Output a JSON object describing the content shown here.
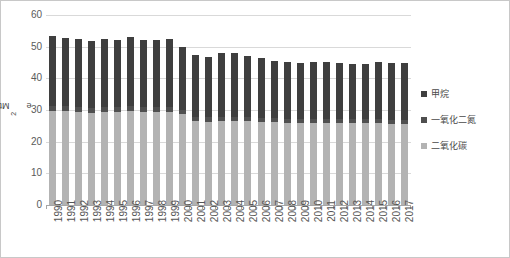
{
  "chart_data": {
    "type": "bar",
    "stacked": true,
    "title": "",
    "xlabel": "",
    "ylabel": "Mtco2e",
    "ylabel_display": "Mtco₂e",
    "ylim": [
      0,
      60
    ],
    "ytick_step": 10,
    "yticks": [
      "60",
      "50",
      "40",
      "30",
      "20",
      "10",
      "0"
    ],
    "grid": true,
    "legend_position": "right",
    "categories": [
      "1990",
      "1991",
      "1992",
      "1993",
      "1994",
      "1995",
      "1996",
      "1997",
      "1998",
      "1999",
      "2000",
      "2001",
      "2002",
      "2003",
      "2004",
      "2005",
      "2006",
      "2007",
      "2008",
      "2009",
      "2010",
      "2011",
      "2012",
      "2013",
      "2014",
      "2015",
      "2016",
      "2017"
    ],
    "series": [
      {
        "name": "二氧化碳",
        "color": "#b3b3b3",
        "values": [
          29.8,
          29.6,
          29.4,
          29.2,
          29.4,
          29.3,
          29.6,
          29.4,
          29.4,
          29.5,
          28.6,
          26.4,
          26.3,
          26.4,
          26.4,
          26.5,
          26.2,
          26.1,
          26.0,
          25.8,
          26.0,
          25.9,
          25.8,
          25.9,
          26.0,
          25.8,
          25.7,
          25.6
        ]
      },
      {
        "name": "一氧化二氮",
        "color": "#4f4f4f",
        "values": [
          1.6,
          1.6,
          1.6,
          1.5,
          1.6,
          1.6,
          1.6,
          1.6,
          1.6,
          1.6,
          1.5,
          1.4,
          1.4,
          1.4,
          1.4,
          1.4,
          1.4,
          1.3,
          1.3,
          1.3,
          1.3,
          1.3,
          1.3,
          1.3,
          1.3,
          1.3,
          1.3,
          1.3
        ]
      },
      {
        "name": "甲烷",
        "color": "#3f3f3f",
        "values": [
          22.0,
          21.7,
          21.5,
          21.0,
          21.5,
          21.3,
          21.9,
          21.1,
          21.1,
          21.2,
          19.9,
          19.7,
          19.2,
          20.2,
          20.1,
          19.3,
          18.8,
          18.2,
          17.9,
          17.9,
          17.9,
          17.9,
          17.6,
          17.2,
          17.2,
          18.0,
          17.9,
          17.9
        ]
      }
    ],
    "totals": [
      53.4,
      52.9,
      52.5,
      51.7,
      52.5,
      52.2,
      53.1,
      52.1,
      52.1,
      52.3,
      50.0,
      47.5,
      46.9,
      48.0,
      47.9,
      47.2,
      46.4,
      45.6,
      45.2,
      45.0,
      45.2,
      45.1,
      44.7,
      44.4,
      44.5,
      45.1,
      44.9,
      44.8
    ]
  },
  "legend": {
    "items": [
      {
        "label": "甲烷",
        "icon": "legend-swatch-ch4"
      },
      {
        "label": "一氧化二氮",
        "icon": "legend-swatch-n2o"
      },
      {
        "label": "二氧化碳",
        "icon": "legend-swatch-co2"
      }
    ]
  },
  "axis": {
    "y_title_main": "Mtco",
    "y_title_sub": "2",
    "y_title_tail": "e"
  }
}
